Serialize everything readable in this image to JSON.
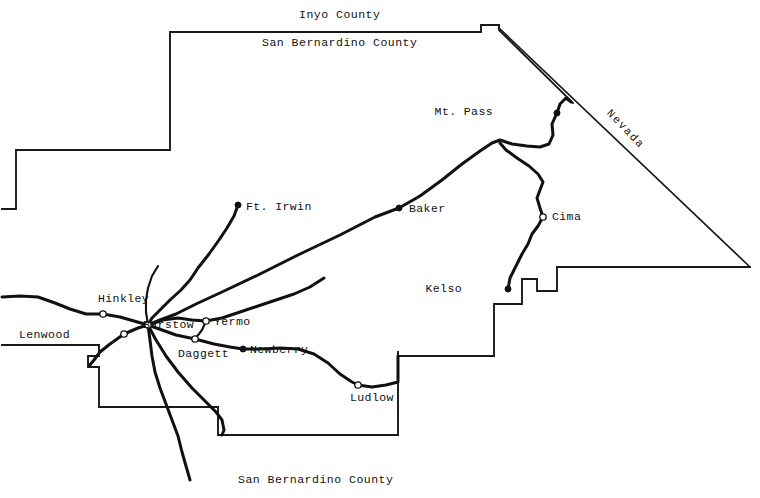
{
  "map": {
    "title": "San Bernardino County Desert Region Road Map",
    "width": 760,
    "height": 498,
    "background_color": "#ffffff",
    "ink_color": "#111111",
    "region_labels": [
      {
        "name": "inyo-county",
        "text": "Inyo County",
        "x": 299,
        "y": 9,
        "type": "county"
      },
      {
        "name": "san-bernardino-county-north",
        "text": "San Bernardino County",
        "x": 262,
        "y": 37,
        "type": "county"
      },
      {
        "name": "san-bernardino-county-south",
        "text": "San Bernardino County",
        "x": 238,
        "y": 474,
        "type": "county"
      },
      {
        "name": "nevada",
        "text": "Nevada",
        "x": 612,
        "y": 108,
        "type": "state",
        "rotation": 46
      }
    ],
    "cities": [
      {
        "name": "mt-pass",
        "label": "Mt. Pass",
        "dot_x": 557,
        "dot_y": 113,
        "dot_style": "filled",
        "label_x": 493,
        "label_y": 106,
        "label_anchor": "right"
      },
      {
        "name": "cima",
        "label": "Cima",
        "dot_x": 543,
        "dot_y": 217,
        "dot_style": "open",
        "label_x": 552,
        "label_y": 211,
        "label_anchor": "left"
      },
      {
        "name": "kelso",
        "label": "Kelso",
        "dot_x": 508,
        "dot_y": 289,
        "dot_style": "filled",
        "label_x": 462,
        "label_y": 283,
        "label_anchor": "right"
      },
      {
        "name": "baker",
        "label": "Baker",
        "dot_x": 399,
        "dot_y": 208,
        "dot_style": "filled",
        "label_x": 409,
        "label_y": 203,
        "label_anchor": "left"
      },
      {
        "name": "ft-irwin",
        "label": "Ft. Irwin",
        "dot_x": 238,
        "dot_y": 205,
        "dot_style": "filled",
        "label_x": 246,
        "label_y": 201,
        "label_anchor": "left"
      },
      {
        "name": "hinkley",
        "label": "Hinkley",
        "dot_x": 103,
        "dot_y": 314,
        "dot_style": "open",
        "label_x": 98,
        "label_y": 293,
        "label_anchor": "left"
      },
      {
        "name": "barstow",
        "label": "Barstow",
        "dot_x": 148,
        "dot_y": 325,
        "dot_style": "open",
        "label_x": 143,
        "label_y": 319,
        "label_anchor": "left"
      },
      {
        "name": "yermo",
        "label": "Yermo",
        "dot_x": 206,
        "dot_y": 321,
        "dot_style": "open",
        "label_x": 214,
        "label_y": 316,
        "label_anchor": "left"
      },
      {
        "name": "lenwood",
        "label": "Lenwood",
        "dot_x": 124,
        "dot_y": 334,
        "dot_style": "open",
        "label_x": 70,
        "label_y": 329,
        "label_anchor": "right"
      },
      {
        "name": "daggett",
        "label": "Daggett",
        "dot_x": 195,
        "dot_y": 339,
        "dot_style": "open",
        "label_x": 178,
        "label_y": 348,
        "label_anchor": "left"
      },
      {
        "name": "newberry",
        "label": "Newberry",
        "dot_x": 243,
        "dot_y": 349,
        "dot_style": "filled",
        "label_x": 250,
        "label_y": 344,
        "label_anchor": "left"
      },
      {
        "name": "ludlow",
        "label": "Ludlow",
        "dot_x": 358,
        "dot_y": 385,
        "dot_style": "open",
        "label_x": 350,
        "label_y": 392,
        "label_anchor": "left"
      }
    ],
    "boundaries": {
      "county_outline": "M 2 209 L 16 209 L 16 150 L 170 150 L 170 32 L 481 32 L 481 25 L 499 25 L 499 30 L 573 103",
      "state_line_nevada": "M 499 28 L 750 267",
      "county_outline_east": "M 750 267 L 557 267 L 557 291 L 537 291 L 537 279 L 522 279 L 522 304 L 494 304 L 494 356 L 398 356 L 398 352",
      "county_outline_south": "M 398 356 L 398 435 L 218 435 L 218 407 L 99 407 L 99 367 L 88 367 L 88 356 L 99 356 L 99 345 L 2 345",
      "county_inner_west": "M 2 345 L 2 345"
    },
    "roads": [
      {
        "name": "interstate-15-north",
        "path": "M 148 325 L 160 320 L 176 314 L 196 304 L 222 292 L 258 275 L 300 254 L 340 235 L 375 217 L 399 208 L 420 196 L 442 180 L 462 164 L 480 151 L 492 143 L 500 140 L 512 144 L 527 146 L 540 147 L 549 144 L 553 135 L 552 124 L 556 115"
      },
      {
        "name": "i15-to-nevada",
        "path": "M 557 113 L 560 104 L 566 98 L 571 102"
      },
      {
        "name": "kelso-cima-road",
        "path": "M 508 289 L 510 278 L 516 266 L 522 254 L 528 244 L 532 234 L 538 226 L 543 217 L 540 208 L 537 198 L 540 190 L 543 182 L 538 174 L 529 166 L 517 158 L 506 150 L 500 143"
      },
      {
        "name": "ft-irwin-road",
        "path": "M 238 205 L 234 216 L 227 228 L 219 240 L 209 254 L 198 268 L 190 280 L 181 290 L 170 300 L 160 310 L 152 318 L 148 325"
      },
      {
        "name": "highway-58-west",
        "path": "M 2 297 L 20 296 L 38 297 L 55 303 L 70 309 L 86 314 L 103 314 L 120 317 L 134 321 L 148 325"
      },
      {
        "name": "barstow-yermo-road",
        "path": "M 148 325 L 163 320 L 178 318 L 192 320 L 206 321 L 222 318 L 240 312 L 258 306 L 276 300 L 294 294 L 310 287 L 324 278"
      },
      {
        "name": "barstow-daggett-newberry",
        "path": "M 148 325 L 162 330 L 176 335 L 195 339 L 214 344 L 230 347 L 243 349 L 262 349 L 280 348 L 298 349 L 314 354 L 328 363 L 340 374 L 352 382 L 358 385 L 372 387 L 386 385 L 398 382 L 398 356"
      },
      {
        "name": "yermo-to-daggett-link",
        "path": "M 206 321 L 202 330 L 195 339"
      },
      {
        "name": "barstow-lenwood-road",
        "path": "M 148 325 L 138 328 L 124 334 L 110 344 L 100 352 L 94 360 L 89 366"
      },
      {
        "name": "barstow-south-road",
        "path": "M 148 325 L 150 340 L 152 356 L 155 372 L 160 388 L 166 404 L 172 420 L 178 436 L 182 452 L 186 466 L 190 480"
      },
      {
        "name": "barstow-southeast-road",
        "path": "M 148 325 L 156 340 L 166 356 L 178 372 L 192 388 L 206 402 L 216 412 L 222 420 L 224 430 L 222 435"
      },
      {
        "name": "north-barstow-spur",
        "path": "M 148 325 L 146 312 L 146 300 L 148 288 L 152 276 L 158 266"
      }
    ]
  }
}
